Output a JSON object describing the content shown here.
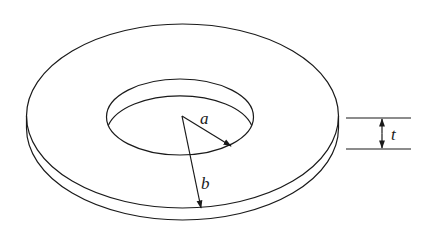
{
  "figure": {
    "labels": {
      "inner_radius": "a",
      "outer_radius": "b",
      "thickness": "t"
    },
    "colors": {
      "line": "#1a1a1a",
      "background": "#ffffff"
    }
  }
}
